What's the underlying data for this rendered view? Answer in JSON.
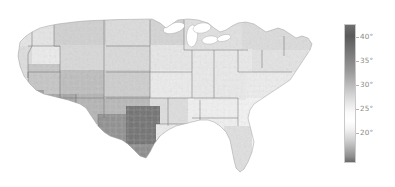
{
  "figure": {
    "background_color": "#ffffff",
    "width": 395,
    "height": 187
  },
  "chart_data": {
    "type": "heatmap",
    "subtype": "choropleth-map",
    "title": "",
    "subtitle": "",
    "xlabel": "",
    "ylabel": "",
    "region": "United States (contiguous, county level)",
    "projection": "albers-usa",
    "grid": false,
    "legend_position": "right",
    "colormap": {
      "name": "grayscale",
      "description": "dark at both extremes, white near mid-range",
      "stops": [
        {
          "position": 0.0,
          "value": 43.5,
          "color": "#6e6e6e"
        },
        {
          "position": 0.08,
          "value": 42.0,
          "color": "#5a5a5a"
        },
        {
          "position": 0.2,
          "value": 39.5,
          "color": "#787878"
        },
        {
          "position": 0.34,
          "value": 36.9,
          "color": "#9a9a9a"
        },
        {
          "position": 0.46,
          "value": 34.5,
          "color": "#c2c2c2"
        },
        {
          "position": 0.56,
          "value": 32.6,
          "color": "#e4e4e4"
        },
        {
          "position": 0.64,
          "value": 31.1,
          "color": "#fbfbfb"
        },
        {
          "position": 0.7,
          "value": 30.0,
          "color": "#ffffff"
        },
        {
          "position": 0.76,
          "value": 28.8,
          "color": "#f2f2f2"
        },
        {
          "position": 0.84,
          "value": 27.3,
          "color": "#d0d0d0"
        },
        {
          "position": 0.9,
          "value": 26.2,
          "color": "#b0b0b0"
        },
        {
          "position": 0.96,
          "value": 25.0,
          "color": "#8e8e8e"
        },
        {
          "position": 1.0,
          "value": 24.2,
          "color": "#6a6a6a"
        }
      ]
    },
    "colorbar": {
      "orientation": "vertical",
      "vmin": 17.0,
      "vmax": 43.5,
      "ticks": [
        {
          "label": "40°",
          "value": 40,
          "y_frac": 0.094
        },
        {
          "label": "35°",
          "value": 35,
          "y_frac": 0.266
        },
        {
          "label": "30°",
          "value": 30,
          "y_frac": 0.438
        },
        {
          "label": "25°",
          "value": 25,
          "y_frac": 0.61
        },
        {
          "label": "20°",
          "value": 20,
          "y_frac": 0.782
        }
      ],
      "tick_label_color": "#8a8a8a"
    },
    "map_style": {
      "state_border_color": "#5a5a5a",
      "state_border_width": 0.45,
      "county_border_color": "#d8d8d8",
      "county_border_width": 0.12,
      "coastline_color": "#9a9a9a",
      "ocean_color": "#ffffff",
      "lake_color": "#ffffff"
    },
    "regional_values": [
      {
        "region": "Pacific Northwest",
        "shade": "#e8e8e8",
        "approx_value": 31.5
      },
      {
        "region": "Northern Rockies / Montana",
        "shade": "#cfcfcf",
        "approx_value": 33.5
      },
      {
        "region": "Idaho / Eastern Oregon",
        "shade": "#f0f0f0",
        "approx_value": 30.6
      },
      {
        "region": "Nevada / Great Basin",
        "shade": "#c8c8c8",
        "approx_value": 34.2
      },
      {
        "region": "Southern California",
        "shade": "#9a9a9a",
        "approx_value": 37.5
      },
      {
        "region": "Arizona / New Mexico",
        "shade": "#a8a8a8",
        "approx_value": 36.5
      },
      {
        "region": "Colorado Plateau",
        "shade": "#bcbcbc",
        "approx_value": 35.0
      },
      {
        "region": "Central Texas",
        "shade": "#6e6e6e",
        "approx_value": 41.5
      },
      {
        "region": "West Texas",
        "shade": "#8c8c8c",
        "approx_value": 38.5
      },
      {
        "region": "Great Plains / Nebraska",
        "shade": "#dcdcdc",
        "approx_value": 32.4
      },
      {
        "region": "Upper Midwest / Minnesota",
        "shade": "#d4d4d4",
        "approx_value": 33.0
      },
      {
        "region": "Great Lakes",
        "shade": "#e6e6e6",
        "approx_value": 31.7
      },
      {
        "region": "Northeast / New England",
        "shade": "#dedede",
        "approx_value": 32.2
      },
      {
        "region": "Appalachia",
        "shade": "#ededed",
        "approx_value": 30.9
      },
      {
        "region": "Southeast / Georgia",
        "shade": "#f7f7f7",
        "approx_value": 30.2
      },
      {
        "region": "Florida",
        "shade": "#e0e0e0",
        "approx_value": 31.9
      },
      {
        "region": "Gulf Coast / Louisiana",
        "shade": "#f2f2f2",
        "approx_value": 30.5
      },
      {
        "region": "Ohio Valley",
        "shade": "#fafafa",
        "approx_value": 30.0
      }
    ]
  },
  "accessibility": {
    "map_alt": "County-level grayscale choropleth of the contiguous United States",
    "colorbar_alt": "Vertical grayscale colorbar with degree ticks from 20 to 40"
  }
}
